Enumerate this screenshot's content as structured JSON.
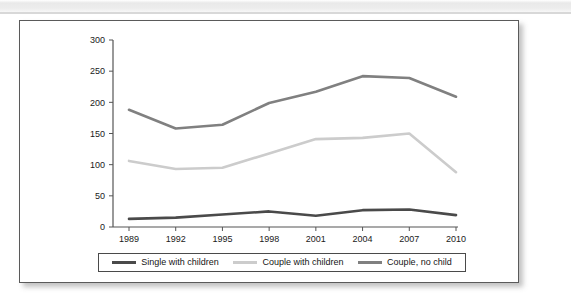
{
  "page": {
    "background_color": "#ffffff",
    "scan_band_color": "#ededed",
    "card_border_color": "#5a5a5a"
  },
  "chart_data": {
    "type": "line",
    "title": "",
    "subtitle": "",
    "xlabel": "",
    "ylabel": "",
    "categories": [
      "1989",
      "1992",
      "1995",
      "1998",
      "2001",
      "2004",
      "2007",
      "2010"
    ],
    "x": [
      1989,
      1992,
      1995,
      1998,
      2001,
      2004,
      2007,
      2010
    ],
    "ylim": [
      0,
      300
    ],
    "yticks": [
      0,
      50,
      100,
      150,
      200,
      250,
      300
    ],
    "ytick_labels": [
      "0",
      "50",
      "100",
      "150",
      "200",
      "250",
      "300"
    ],
    "grid": false,
    "legend_position": "bottom",
    "series": [
      {
        "name": "Single with children",
        "color": "#4a4a4a",
        "values": [
          13,
          15,
          20,
          25,
          18,
          27,
          28,
          19
        ]
      },
      {
        "name": "Couple with children",
        "color": "#cccccc",
        "values": [
          106,
          93,
          95,
          118,
          141,
          143,
          150,
          88
        ]
      },
      {
        "name": "Couple, no child",
        "color": "#808080",
        "values": [
          188,
          158,
          164,
          199,
          217,
          242,
          239,
          209
        ]
      }
    ]
  },
  "legend": {
    "items": [
      {
        "label": "Single with children",
        "color": "#4a4a4a"
      },
      {
        "label": "Couple with children",
        "color": "#cccccc"
      },
      {
        "label": "Couple, no child",
        "color": "#808080"
      }
    ]
  },
  "axes": {
    "y_tick_labels": [
      "300",
      "250",
      "200",
      "150",
      "100",
      "50",
      "0"
    ],
    "x_tick_labels": [
      "1989",
      "1992",
      "1995",
      "1998",
      "2001",
      "2004",
      "2007",
      "2010"
    ]
  }
}
